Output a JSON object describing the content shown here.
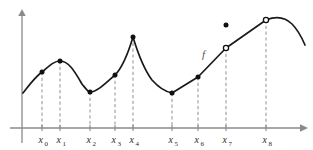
{
  "figure": {
    "function_label": "f",
    "colors": {
      "curve": "#1a1a1a",
      "axis": "#8a8a8a",
      "dashed_drop_line": "#9a9a9a",
      "background": "#ffffff",
      "label_text": "#2b2b2b",
      "function_label_text": "#555555"
    }
  },
  "axes": {
    "x_axis": {
      "y_pixel": 128,
      "x_start": 10,
      "x_end": 303,
      "has_arrow": true
    },
    "y_axis": {
      "x_pixel": 22,
      "y_bottom": 142,
      "y_top": 13,
      "has_arrow": true
    }
  },
  "chart_data": {
    "type": "line",
    "xlabel": "",
    "ylabel": "",
    "grid": false,
    "legend": "none",
    "annotations": [
      {
        "text": "f",
        "x_pixel": 202,
        "y_pixel": 58,
        "italic": true
      }
    ],
    "tick_labels": [
      {
        "base": "x",
        "sub": "0",
        "x_pixel": 42
      },
      {
        "base": "x",
        "sub": "1",
        "x_pixel": 60
      },
      {
        "base": "x",
        "sub": "2",
        "x_pixel": 90
      },
      {
        "base": "x",
        "sub": "3",
        "x_pixel": 115
      },
      {
        "base": "x",
        "sub": "4",
        "x_pixel": 133
      },
      {
        "base": "x",
        "sub": "5",
        "x_pixel": 172
      },
      {
        "base": "x",
        "sub": "6",
        "x_pixel": 198
      },
      {
        "base": "x",
        "sub": "7",
        "x_pixel": 226
      },
      {
        "base": "x",
        "sub": "8",
        "x_pixel": 266
      }
    ],
    "marked_points": [
      {
        "label": "x0",
        "x_pixel": 42,
        "y_pixel": 72,
        "marker": "filled",
        "kind": "rising-point"
      },
      {
        "label": "x1",
        "x_pixel": 60,
        "y_pixel": 61,
        "marker": "filled",
        "kind": "local-maximum"
      },
      {
        "label": "x2",
        "x_pixel": 90,
        "y_pixel": 92,
        "marker": "filled",
        "kind": "local-minimum"
      },
      {
        "label": "x3",
        "x_pixel": 115,
        "y_pixel": 75,
        "marker": "filled",
        "kind": "rising-point"
      },
      {
        "label": "x4",
        "x_pixel": 133,
        "y_pixel": 37,
        "marker": "filled",
        "kind": "cusp-maximum"
      },
      {
        "label": "x5",
        "x_pixel": 172,
        "y_pixel": 93,
        "marker": "filled",
        "kind": "local-minimum"
      },
      {
        "label": "x6",
        "x_pixel": 198,
        "y_pixel": 77,
        "marker": "filled",
        "kind": "corner-point"
      },
      {
        "label": "x7",
        "x_pixel": 226,
        "y_pixel": 48,
        "marker": "open",
        "kind": "removable-discontinuity-hole"
      },
      {
        "label": "x7",
        "x_pixel": 226,
        "y_pixel": 25,
        "marker": "filled",
        "kind": "removable-discontinuity-value"
      },
      {
        "label": "x8",
        "x_pixel": 266,
        "y_pixel": 20,
        "marker": "open",
        "kind": "endpoint-hole"
      }
    ],
    "drop_lines": [
      {
        "label": "x0",
        "x_pixel": 42,
        "y_top": 72,
        "y_bottom": 128
      },
      {
        "label": "x1",
        "x_pixel": 60,
        "y_top": 61,
        "y_bottom": 128
      },
      {
        "label": "x2",
        "x_pixel": 90,
        "y_top": 92,
        "y_bottom": 128
      },
      {
        "label": "x3",
        "x_pixel": 115,
        "y_top": 75,
        "y_bottom": 128
      },
      {
        "label": "x4",
        "x_pixel": 133,
        "y_top": 37,
        "y_bottom": 128
      },
      {
        "label": "x5",
        "x_pixel": 172,
        "y_top": 93,
        "y_bottom": 128
      },
      {
        "label": "x6",
        "x_pixel": 198,
        "y_top": 77,
        "y_bottom": 128
      },
      {
        "label": "x7",
        "x_pixel": 226,
        "y_top": 48,
        "y_bottom": 128
      },
      {
        "label": "x8",
        "x_pixel": 266,
        "y_top": 20,
        "y_bottom": 128
      }
    ],
    "curve_path": "M 23,93 C 30,84 35,77 42,72 C 49,66 54,61 60,61 C 69,61 75,72 82,84 C 86,89 88,92 90,92 C 97,92 106,83 115,75 C 123,67 130,47 133,37 C 136,47 143,68 152,80 C 160,89 167,92 172,93 C 180,88 190,82 198,77 L 226,48 L 266,20 C 276,16 285,17 292,24 C 298,30 302,38 305,45",
    "curve_segments": [
      {
        "name": "smooth-hump-to-x1",
        "from": "y-axis",
        "to": "x1",
        "shape": "concave-hump"
      },
      {
        "name": "descend-to-x2",
        "from": "x1",
        "to": "x2",
        "shape": "descending"
      },
      {
        "name": "rise-to-cusp",
        "from": "x2",
        "to": "x4",
        "shape": "ascending-to-cusp"
      },
      {
        "name": "fall-to-x5",
        "from": "x4",
        "to": "x5",
        "shape": "descending-concave"
      },
      {
        "name": "rise-to-x6",
        "from": "x5",
        "to": "x6",
        "shape": "ascending-curve"
      },
      {
        "name": "straight-line-x6-to-x8",
        "from": "x6",
        "to": "x8",
        "shape": "linear"
      },
      {
        "name": "final-arc-after-x8",
        "from": "x8",
        "to": "end",
        "shape": "concave-down-arc"
      }
    ]
  }
}
